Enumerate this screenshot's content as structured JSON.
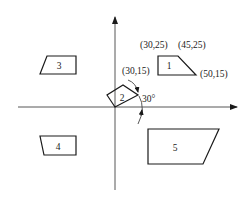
{
  "diagram": {
    "type": "2D transformation diagram",
    "axes": {
      "x_axis": {
        "from": [
          18,
          107
        ],
        "to": [
          237,
          107
        ],
        "arrow": "right"
      },
      "y_axis": {
        "from": [
          115,
          190
        ],
        "to": [
          115,
          17
        ],
        "arrow": "up"
      }
    },
    "shapes": [
      {
        "id": "1",
        "label": "1",
        "points": "158,56 178,56 196,75 158,75",
        "label_pos": [
          169,
          69
        ]
      },
      {
        "id": "2",
        "label": "2",
        "points": "115,107 107,95 123,85 138,95",
        "label_pos": [
          122,
          101
        ]
      },
      {
        "id": "3",
        "label": "3",
        "points": "40,74 47,56 76,56 76,74",
        "label_pos": [
          59,
          69
        ]
      },
      {
        "id": "4",
        "label": "4",
        "points": "40,136 76,136 76,155 44,155",
        "label_pos": [
          58,
          150
        ]
      },
      {
        "id": "5",
        "label": "5",
        "points": "148,129 219,129 203,164 148,164",
        "label_pos": [
          175,
          151
        ]
      }
    ],
    "coordinate_labels": [
      {
        "text": "(30,25)",
        "pos": [
          140,
          48
        ]
      },
      {
        "text": "(45,25)",
        "pos": [
          178,
          48
        ]
      },
      {
        "text": "(50,15)",
        "pos": [
          200,
          77
        ]
      },
      {
        "text": "(30,15)",
        "pos": [
          122,
          74
        ]
      }
    ],
    "rotation": {
      "angle_label": "30°",
      "label_pos": [
        142,
        102
      ]
    },
    "colors": {
      "stroke": "#1a1a1a",
      "axis": "#444444",
      "background": "#ffffff"
    }
  }
}
